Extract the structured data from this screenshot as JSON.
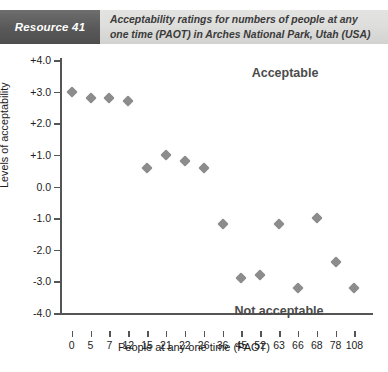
{
  "header": {
    "resource_tag": "Resource 41",
    "title_line1": "Acceptability ratings for numbers of people at any",
    "title_line2": "one time (PAOT) in Arches National Park, Utah (USA)",
    "tag_bg": "#5a5a5a",
    "band_bg": "#dededc"
  },
  "chart_data": {
    "type": "scatter",
    "title": "Acceptability ratings for numbers of people at any one time (PAOT) in Arches National Park, Utah (USA)",
    "xlabel": "People at any one time (PAOT)",
    "ylabel": "Levels of acceptability",
    "categories": [
      "0",
      "5",
      "7",
      "12",
      "15",
      "21",
      "22",
      "26",
      "36",
      "45",
      "52",
      "63",
      "66",
      "68",
      "78",
      "108"
    ],
    "values": [
      3.0,
      2.8,
      2.8,
      2.7,
      0.6,
      1.0,
      0.8,
      0.6,
      -1.2,
      -2.9,
      -2.8,
      -1.2,
      -3.2,
      -1.0,
      -2.4,
      -3.2
    ],
    "ylim": [
      -4.0,
      4.0
    ],
    "ytick_labels": [
      "+4.0",
      "+3.0",
      "+2.0",
      "+1.0",
      "0.0",
      "-1.0",
      "-2.0",
      "-3.0",
      "-4.0"
    ],
    "ytick_values": [
      4.0,
      3.0,
      2.0,
      1.0,
      0.0,
      -1.0,
      -2.0,
      -3.0,
      -4.0
    ],
    "grid": false,
    "legend": "none",
    "marker": "diamond",
    "marker_color": "#8c8c8c",
    "annotations": [
      {
        "text": "Acceptable",
        "region": "upper"
      },
      {
        "text": "Not acceptable",
        "region": "lower"
      }
    ]
  }
}
